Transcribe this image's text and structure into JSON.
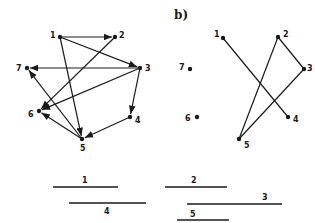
{
  "panel_b_label": "b)",
  "graph_a": {
    "directed": true,
    "nodes": [
      {
        "id": "1",
        "label": "1",
        "x": 60,
        "y": 37,
        "lx": 50,
        "ly": 38
      },
      {
        "id": "2",
        "label": "2",
        "x": 115,
        "y": 37,
        "lx": 119,
        "ly": 38
      },
      {
        "id": "3",
        "label": "3",
        "x": 140,
        "y": 68,
        "lx": 145,
        "ly": 71
      },
      {
        "id": "4",
        "label": "4",
        "x": 130,
        "y": 117,
        "lx": 135,
        "ly": 123
      },
      {
        "id": "5",
        "label": "5",
        "x": 82,
        "y": 139,
        "lx": 80,
        "ly": 151
      },
      {
        "id": "6",
        "label": "6",
        "x": 39,
        "y": 111,
        "lx": 28,
        "ly": 117
      },
      {
        "id": "7",
        "label": "7",
        "x": 27,
        "y": 68,
        "lx": 16,
        "ly": 71
      }
    ],
    "edges": [
      {
        "from": "1",
        "to": "2"
      },
      {
        "from": "1",
        "to": "3"
      },
      {
        "from": "1",
        "to": "5"
      },
      {
        "from": "2",
        "to": "6"
      },
      {
        "from": "3",
        "to": "7"
      },
      {
        "from": "3",
        "to": "6"
      },
      {
        "from": "3",
        "to": "4"
      },
      {
        "from": "4",
        "to": "5"
      },
      {
        "from": "5",
        "to": "6"
      },
      {
        "from": "5",
        "to": "7"
      }
    ]
  },
  "graph_b": {
    "directed": false,
    "nodes": [
      {
        "id": "1",
        "label": "1",
        "x": 223,
        "y": 38,
        "lx": 214,
        "ly": 37
      },
      {
        "id": "2",
        "label": "2",
        "x": 278,
        "y": 37,
        "lx": 283,
        "ly": 37
      },
      {
        "id": "3",
        "label": "3",
        "x": 304,
        "y": 69,
        "lx": 307,
        "ly": 71
      },
      {
        "id": "4",
        "label": "4",
        "x": 288,
        "y": 117,
        "lx": 293,
        "ly": 122
      },
      {
        "id": "5",
        "label": "5",
        "x": 239,
        "y": 139,
        "lx": 244,
        "ly": 148
      },
      {
        "id": "6",
        "label": "6",
        "x": 197,
        "y": 117,
        "lx": 185,
        "ly": 121
      },
      {
        "id": "7",
        "label": "7",
        "x": 190,
        "y": 69,
        "lx": 179,
        "ly": 70
      }
    ],
    "edges": [
      {
        "from": "1",
        "to": "4"
      },
      {
        "from": "2",
        "to": "3"
      },
      {
        "from": "2",
        "to": "5"
      },
      {
        "from": "3",
        "to": "5"
      }
    ]
  },
  "intervals": [
    {
      "label": "1",
      "x1": 53,
      "x2": 118,
      "y": 187,
      "lx": 82,
      "ly": 183
    },
    {
      "label": "4",
      "x1": 69,
      "x2": 146,
      "y": 203,
      "lx": 104,
      "ly": 214
    },
    {
      "label": "2",
      "x1": 165,
      "x2": 227,
      "y": 187,
      "lx": 191,
      "ly": 183
    },
    {
      "label": "3",
      "x1": 187,
      "x2": 282,
      "y": 204,
      "lx": 262,
      "ly": 200
    },
    {
      "label": "5",
      "x1": 177,
      "x2": 229,
      "y": 220,
      "lx": 190,
      "ly": 217
    }
  ]
}
